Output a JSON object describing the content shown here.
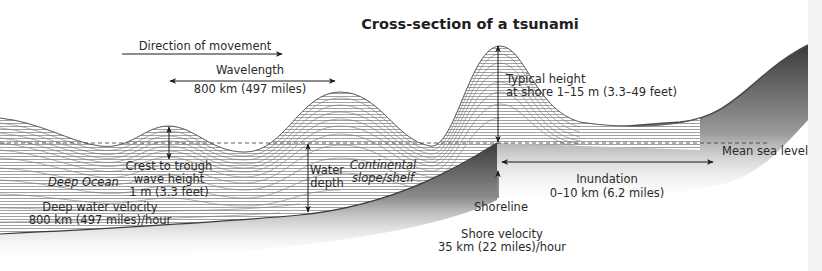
{
  "title": "Cross-section of a tsunami",
  "labels": {
    "direction": "Direction of movement",
    "wavelength_title": "Wavelength",
    "wavelength_value": "800 km (497 miles)",
    "typical_height_line1": "Typical height",
    "typical_height_line2": "at shore 1–15 m (3.3–49 feet)",
    "crest_line1": "Crest to trough",
    "crest_line2": "wave height",
    "crest_line3": "1 m (3.3 feet)",
    "deep_ocean": "Deep Ocean",
    "deep_velocity_line1": "Deep water velocity",
    "deep_velocity_line2": "800 km (497 miles)/hour",
    "water_depth_line1": "Water",
    "water_depth_line2": "depth",
    "continental_line1": "Continental",
    "continental_line2": "slope/shelf",
    "mean_sea_level": "Mean sea level",
    "inundation_title": "Inundation",
    "inundation_value": "0–10 km (6.2 miles)",
    "shoreline": "Shoreline",
    "shore_velocity_line1": "Shore velocity",
    "shore_velocity_line2": "35 km (22 miles)/hour"
  },
  "colors": {
    "background": "#ffffff",
    "wave_lines": "#6a6a6a",
    "seafloor_dark": "#4a4a4a",
    "text": "#2a2a2a",
    "right_strip": "#f2f2f2"
  }
}
